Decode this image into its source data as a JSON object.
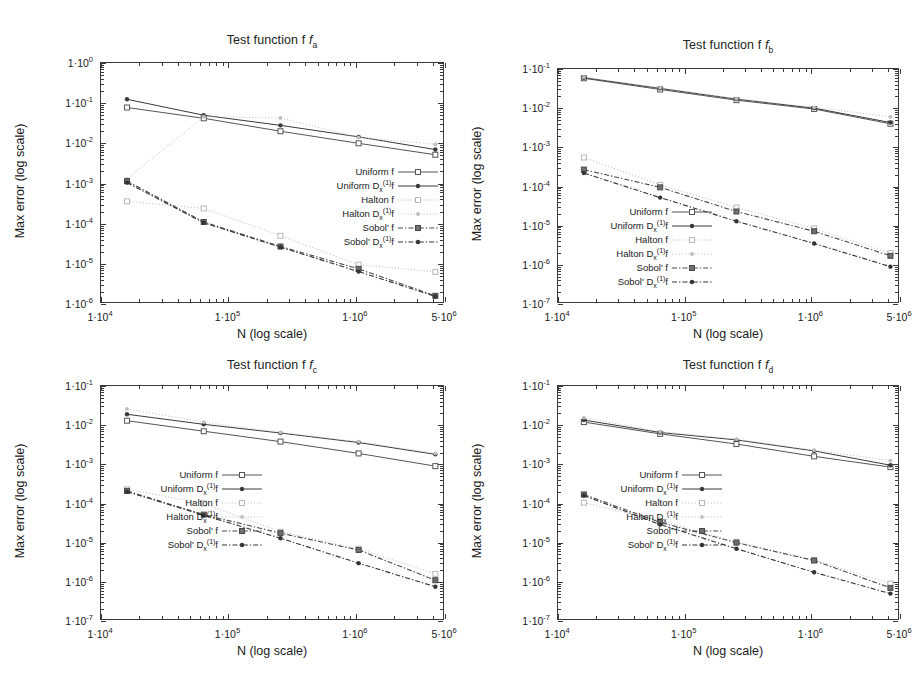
{
  "figure": {
    "axis_title_x": "N (log scale)",
    "axis_title_y": "Max error (log scale)"
  },
  "series_styles": [
    {
      "key": "uniform_f",
      "label_html": "Uniform f",
      "color": "#555555",
      "dash": "none",
      "marker": "square-open",
      "width": 1.0
    },
    {
      "key": "uniform_df",
      "label_html": "Uniform D<sub>x</sub><sup>(1)</sup>f",
      "color": "#3a3a3a",
      "dash": "none",
      "marker": "dot-filled",
      "width": 1.0
    },
    {
      "key": "halton_f",
      "label_html": "Halton f",
      "color": "#b8b8b8",
      "dash": "dotted",
      "marker": "square-open-light",
      "width": 1.0
    },
    {
      "key": "halton_df",
      "label_html": "Halton D<sub>x</sub><sup>(1)</sup>f",
      "color": "#bdbdbd",
      "dash": "dotted",
      "marker": "dot-light",
      "width": 1.0
    },
    {
      "key": "sobol_f",
      "label_html": "Sobol' f",
      "color": "#4a4a4a",
      "dash": "dashdot",
      "marker": "square-filled",
      "width": 1.1
    },
    {
      "key": "sobol_df",
      "label_html": "Sobol' D<sub>x</sub><sup>(1)</sup>f",
      "color": "#333333",
      "dash": "dashdot",
      "marker": "dot-filled",
      "width": 1.1
    }
  ],
  "chart_data": [
    {
      "id": "fa",
      "type": "line",
      "title": "Test function f",
      "title_sub": "a",
      "xlabel": "N (log scale)",
      "ylabel": "Max error (log scale)",
      "xscale": "log",
      "yscale": "log",
      "xlim": [
        10000,
        5000000
      ],
      "ylim": [
        1e-06,
        1
      ],
      "xticks": [
        {
          "value": 10000,
          "label_mant": "1",
          "label_exp": "4"
        },
        {
          "value": 100000,
          "label_mant": "1",
          "label_exp": "5"
        },
        {
          "value": 1000000,
          "label_mant": "1",
          "label_exp": "6"
        },
        {
          "value": 5000000,
          "label_mant": "5",
          "label_exp": "6"
        }
      ],
      "yticks": [
        {
          "value": 1,
          "label_mant": "1",
          "label_exp": "0"
        },
        {
          "value": 0.1,
          "label_mant": "1",
          "label_exp": "-1"
        },
        {
          "value": 0.01,
          "label_mant": "1",
          "label_exp": "-2"
        },
        {
          "value": 0.001,
          "label_mant": "1",
          "label_exp": "-3"
        },
        {
          "value": 0.0001,
          "label_mant": "1",
          "label_exp": "-4"
        },
        {
          "value": 1e-05,
          "label_mant": "1",
          "label_exp": "-5"
        },
        {
          "value": 1e-06,
          "label_mant": "1",
          "label_exp": "-6"
        }
      ],
      "x": [
        16000,
        64000,
        256000,
        1050000,
        4200000
      ],
      "series": [
        {
          "name": "uniform_f",
          "values": [
            0.078,
            0.042,
            0.02,
            0.01,
            0.0052
          ]
        },
        {
          "name": "uniform_df",
          "values": [
            0.125,
            0.05,
            0.028,
            0.0145,
            0.007
          ]
        },
        {
          "name": "halton_f",
          "values": [
            0.00036,
            0.00024,
            5e-05,
            9.5e-06,
            6.3e-06
          ]
        },
        {
          "name": "halton_df",
          "values": [
            0.0013,
            0.046,
            0.043,
            0.014,
            0.0095
          ]
        },
        {
          "name": "sobol_f",
          "values": [
            0.00115,
            0.00011,
            2.7e-05,
            7.5e-06,
            1.6e-06
          ]
        },
        {
          "name": "sobol_df",
          "values": [
            0.00105,
            0.000105,
            2.6e-05,
            6.4e-06,
            1.55e-06
          ]
        }
      ],
      "legend_position": "center-right"
    },
    {
      "id": "fb",
      "type": "line",
      "title": "Test function f",
      "title_sub": "b",
      "xlabel": "N (log scale)",
      "ylabel": "Max error (log scale)",
      "xscale": "log",
      "yscale": "log",
      "xlim": [
        10000,
        5000000
      ],
      "ylim": [
        1e-07,
        0.1
      ],
      "xticks": [
        {
          "value": 10000,
          "label_mant": "1",
          "label_exp": "4"
        },
        {
          "value": 100000,
          "label_mant": "1",
          "label_exp": "5"
        },
        {
          "value": 1000000,
          "label_mant": "1",
          "label_exp": "6"
        },
        {
          "value": 5000000,
          "label_mant": "5",
          "label_exp": "6"
        }
      ],
      "yticks": [
        {
          "value": 0.1,
          "label_mant": "1",
          "label_exp": "-1"
        },
        {
          "value": 0.01,
          "label_mant": "1",
          "label_exp": "-2"
        },
        {
          "value": 0.001,
          "label_mant": "1",
          "label_exp": "-3"
        },
        {
          "value": 0.0001,
          "label_mant": "1",
          "label_exp": "-4"
        },
        {
          "value": 1e-05,
          "label_mant": "1",
          "label_exp": "-5"
        },
        {
          "value": 1e-06,
          "label_mant": "1",
          "label_exp": "-6"
        },
        {
          "value": 1e-07,
          "label_mant": "1",
          "label_exp": "-7"
        }
      ],
      "x": [
        16000,
        64000,
        256000,
        1050000,
        4200000
      ],
      "series": [
        {
          "name": "uniform_f",
          "values": [
            0.058,
            0.03,
            0.016,
            0.0095,
            0.004
          ]
        },
        {
          "name": "uniform_df",
          "values": [
            0.06,
            0.032,
            0.017,
            0.01,
            0.0043
          ]
        },
        {
          "name": "halton_f",
          "values": [
            0.00055,
            0.00011,
            2.9e-05,
            8.5e-06,
            2e-06
          ]
        },
        {
          "name": "halton_df",
          "values": [
            0.062,
            0.033,
            0.0175,
            0.0105,
            0.006
          ]
        },
        {
          "name": "sobol_f",
          "values": [
            0.00027,
            9.5e-05,
            2.3e-05,
            7.2e-06,
            1.7e-06
          ]
        },
        {
          "name": "sobol_df",
          "values": [
            0.00022,
            5.2e-05,
            1.3e-05,
            3.5e-06,
            9e-07
          ]
        }
      ],
      "legend_position": "lower-left"
    },
    {
      "id": "fc",
      "type": "line",
      "title": "Test function f",
      "title_sub": "c",
      "xlabel": "N (log scale)",
      "ylabel": "Max error (log scale)",
      "xscale": "log",
      "yscale": "log",
      "xlim": [
        10000,
        5000000
      ],
      "ylim": [
        1e-07,
        0.1
      ],
      "xticks": [
        {
          "value": 10000,
          "label_mant": "1",
          "label_exp": "4"
        },
        {
          "value": 100000,
          "label_mant": "1",
          "label_exp": "5"
        },
        {
          "value": 1000000,
          "label_mant": "1",
          "label_exp": "6"
        },
        {
          "value": 5000000,
          "label_mant": "5",
          "label_exp": "6"
        }
      ],
      "yticks": [
        {
          "value": 0.1,
          "label_mant": "1",
          "label_exp": "-1"
        },
        {
          "value": 0.01,
          "label_mant": "1",
          "label_exp": "-2"
        },
        {
          "value": 0.001,
          "label_mant": "1",
          "label_exp": "-3"
        },
        {
          "value": 0.0001,
          "label_mant": "1",
          "label_exp": "-4"
        },
        {
          "value": 1e-05,
          "label_mant": "1",
          "label_exp": "-5"
        },
        {
          "value": 1e-06,
          "label_mant": "1",
          "label_exp": "-6"
        },
        {
          "value": 1e-07,
          "label_mant": "1",
          "label_exp": "-7"
        }
      ],
      "x": [
        16000,
        64000,
        256000,
        1050000,
        4200000
      ],
      "series": [
        {
          "name": "uniform_f",
          "values": [
            0.013,
            0.007,
            0.0038,
            0.0019,
            0.0009
          ]
        },
        {
          "name": "uniform_df",
          "values": [
            0.019,
            0.0105,
            0.0063,
            0.0036,
            0.0018
          ]
        },
        {
          "name": "halton_f",
          "values": [
            0.00023,
            0.0001,
            1.9e-05,
            7e-06,
            1.6e-06
          ]
        },
        {
          "name": "halton_df",
          "values": [
            0.026,
            0.012,
            0.0065,
            0.0038,
            0.0019
          ]
        },
        {
          "name": "sobol_f",
          "values": [
            0.00021,
            5.2e-05,
            1.75e-05,
            6.5e-06,
            1.1e-06
          ]
        },
        {
          "name": "sobol_df",
          "values": [
            0.0002,
            5e-05,
            1.3e-05,
            3e-06,
            7.5e-07
          ]
        }
      ],
      "legend_position": "lower-left"
    },
    {
      "id": "fd",
      "type": "line",
      "title": "Test function f",
      "title_sub": "d",
      "xlabel": "N (log scale)",
      "ylabel": "Max error (log scale)",
      "xscale": "log",
      "yscale": "log",
      "xlim": [
        10000,
        5000000
      ],
      "ylim": [
        1e-07,
        0.1
      ],
      "xticks": [
        {
          "value": 10000,
          "label_mant": "1",
          "label_exp": "4"
        },
        {
          "value": 100000,
          "label_mant": "1",
          "label_exp": "5"
        },
        {
          "value": 1000000,
          "label_mant": "1",
          "label_exp": "6"
        },
        {
          "value": 5000000,
          "label_mant": "5",
          "label_exp": "6"
        }
      ],
      "yticks": [
        {
          "value": 0.1,
          "label_mant": "1",
          "label_exp": "-1"
        },
        {
          "value": 0.01,
          "label_mant": "1",
          "label_exp": "-2"
        },
        {
          "value": 0.001,
          "label_mant": "1",
          "label_exp": "-3"
        },
        {
          "value": 0.0001,
          "label_mant": "1",
          "label_exp": "-4"
        },
        {
          "value": 1e-05,
          "label_mant": "1",
          "label_exp": "-5"
        },
        {
          "value": 1e-06,
          "label_mant": "1",
          "label_exp": "-6"
        },
        {
          "value": 1e-07,
          "label_mant": "1",
          "label_exp": "-7"
        }
      ],
      "x": [
        16000,
        64000,
        256000,
        1050000,
        4200000
      ],
      "series": [
        {
          "name": "uniform_f",
          "values": [
            0.012,
            0.006,
            0.0033,
            0.0016,
            0.00085
          ]
        },
        {
          "name": "uniform_df",
          "values": [
            0.0135,
            0.0065,
            0.0042,
            0.0022,
            0.00095
          ]
        },
        {
          "name": "halton_f",
          "values": [
            0.000105,
            3.6e-05,
            1.05e-05,
            3.6e-06,
            9e-07
          ]
        },
        {
          "name": "halton_df",
          "values": [
            0.0155,
            0.0068,
            0.0044,
            0.0023,
            0.00125
          ]
        },
        {
          "name": "sobol_f",
          "values": [
            0.00017,
            3.3e-05,
            1e-05,
            3.5e-06,
            7e-07
          ]
        },
        {
          "name": "sobol_df",
          "values": [
            0.00016,
            2.9e-05,
            7e-06,
            1.75e-06,
            5e-07
          ]
        }
      ],
      "legend_position": "lower-left"
    }
  ]
}
